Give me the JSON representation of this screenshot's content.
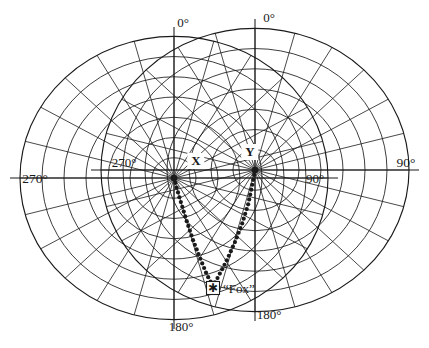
{
  "figure": {
    "type": "polar-direction-finding-plot",
    "background_color": "#ffffff",
    "line_color": "#1a1a1a",
    "width": 429,
    "height": 348
  },
  "stations": [
    {
      "id": "X",
      "label": "X",
      "label_x": 196,
      "label_y": 161,
      "center_x": 174,
      "center_y": 178,
      "ring_count": 7,
      "ring_spacing": 22,
      "spoke_step_deg": 15,
      "grid_rotation_deg": 0,
      "scale_y": 0.92
    },
    {
      "id": "Y",
      "label": "Y",
      "label_x": 250,
      "label_y": 152,
      "center_x": 255,
      "center_y": 170,
      "ring_count": 7,
      "ring_spacing": 22,
      "spoke_step_deg": 15,
      "grid_rotation_deg": 0,
      "scale_y": 0.92
    }
  ],
  "axis_labels": [
    {
      "name": "x-zero",
      "text": "0°",
      "x": 183,
      "y": 22,
      "anchor": "middle",
      "size": "deg"
    },
    {
      "name": "y-zero",
      "text": "0°",
      "x": 269,
      "y": 17,
      "anchor": "middle",
      "size": "deg"
    },
    {
      "name": "x-ninety-inner",
      "text": "90°",
      "x": 315,
      "y": 178,
      "anchor": "middle",
      "size": "deg"
    },
    {
      "name": "y-ninety-outer",
      "text": "90°",
      "x": 406,
      "y": 163,
      "anchor": "middle",
      "size": "deg-outer"
    },
    {
      "name": "x-twoseventy-outer",
      "text": "270°",
      "x": 35,
      "y": 179,
      "anchor": "middle",
      "size": "deg-outer"
    },
    {
      "name": "y-twoseventy-inner",
      "text": "270°",
      "x": 124,
      "y": 162,
      "anchor": "middle",
      "size": "deg"
    },
    {
      "name": "x-oneeighty",
      "text": "180°",
      "x": 181,
      "y": 326,
      "anchor": "middle",
      "size": "deg"
    },
    {
      "name": "y-oneeighty",
      "text": "180°",
      "x": 269,
      "y": 314,
      "anchor": "middle",
      "size": "deg"
    }
  ],
  "target": {
    "id": "fox",
    "label": "“Fox”",
    "marker": "boxed-star",
    "marker_x": 213,
    "marker_y": 288,
    "marker_size": 13,
    "label_x": 223,
    "label_y": 283
  },
  "bearing_lines": [
    {
      "name": "bearing-from-x",
      "from_station": "X",
      "style": "dotted",
      "dot_size": 2.1,
      "path": [
        [
          174,
          178
        ],
        [
          179,
          196
        ],
        [
          186,
          219
        ],
        [
          193,
          240
        ],
        [
          200,
          258
        ],
        [
          207,
          275
        ],
        [
          212,
          284
        ]
      ]
    },
    {
      "name": "bearing-from-y",
      "from_station": "Y",
      "style": "dotted",
      "dot_size": 2.1,
      "path": [
        [
          255,
          170
        ],
        [
          252,
          186
        ],
        [
          248,
          205
        ],
        [
          242,
          224
        ],
        [
          235,
          242
        ],
        [
          226,
          262
        ],
        [
          217,
          279
        ],
        [
          213,
          285
        ]
      ]
    }
  ],
  "chart_data": {
    "type": "scatter",
    "title": "",
    "grid": true,
    "legend": "none"
  }
}
